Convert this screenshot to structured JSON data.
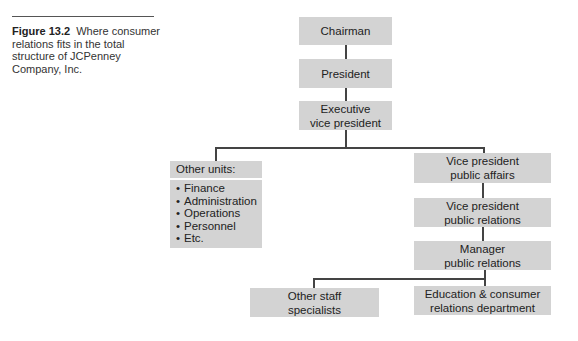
{
  "caption": {
    "label": "Figure 13.2",
    "text": "Where consumer relations fits in the total structure of JCPenney Company, Inc."
  },
  "nodes": {
    "chairman": "Chairman",
    "president": "President",
    "exec_vp": [
      "Executive",
      "vice president"
    ],
    "other_units": {
      "title": "Other units:",
      "bullet": "•",
      "items": [
        "Finance",
        "Administration",
        "Operations",
        "Personnel",
        "Etc."
      ]
    },
    "vp_public_affairs": [
      "Vice president",
      "public affairs"
    ],
    "vp_public_relations": [
      "Vice president",
      "public relations"
    ],
    "manager_pr": [
      "Manager",
      "public relations"
    ],
    "other_staff": [
      "Other staff",
      "specialists"
    ],
    "education_consumer": [
      "Education & consumer",
      "relations department"
    ]
  }
}
